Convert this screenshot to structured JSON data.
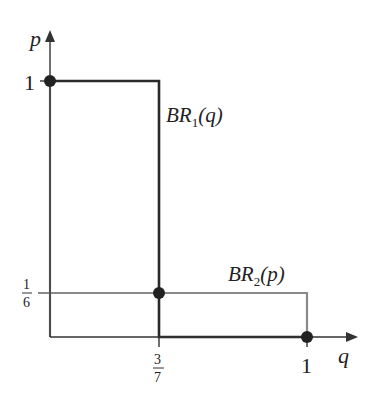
{
  "diagram": {
    "type": "best-response",
    "axes": {
      "x_label": "q",
      "y_label": "p"
    },
    "ticks": {
      "y_one": "1",
      "y_frac_num": "1",
      "y_frac_den": "6",
      "x_frac_num": "3",
      "x_frac_den": "7",
      "x_one": "1"
    },
    "curves": [
      {
        "name": "BR1",
        "label_main": "BR",
        "label_sub": "1",
        "label_arg": "(q)",
        "color": "#2a2a2a"
      },
      {
        "name": "BR2",
        "label_main": "BR",
        "label_sub": "2",
        "label_arg": "(p)",
        "color": "#8a8a8a"
      }
    ],
    "equilibria": [
      {
        "q": "0",
        "p": "1"
      },
      {
        "q": "3/7",
        "p": "1/6"
      },
      {
        "q": "1",
        "p": "0"
      }
    ]
  }
}
